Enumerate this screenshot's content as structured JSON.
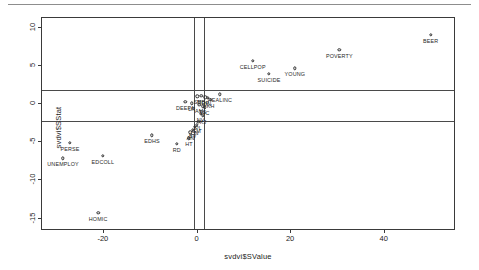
{
  "figure": {
    "x_axis_title": "svdvi$SValue",
    "y_axis_title": "svdvi$SStat",
    "x_ticks": [
      -20,
      0,
      20,
      40
    ],
    "y_ticks": [
      10,
      5,
      0,
      -5,
      -10,
      -15
    ],
    "x_tick_labels": [
      "-20",
      "0",
      "20",
      "40"
    ],
    "y_tick_labels": [
      "10",
      "5",
      "0",
      "-5",
      "-10",
      "-15"
    ],
    "xlim": [
      -33,
      55
    ],
    "ylim": [
      -16.5,
      11.2
    ],
    "grid": false,
    "frame": true,
    "reference_lines": {
      "vertical": [
        -0.6,
        1.7
      ],
      "horizontal": [
        1.8,
        -2.3
      ]
    },
    "marker_color": "#2e2e2e",
    "line_color": "#4a4a4a"
  },
  "chart_data": {
    "type": "scatter",
    "title": "",
    "xlabel": "svdvi$SValue",
    "ylabel": "svdvi$SStat",
    "xlim": [
      -33,
      55
    ],
    "ylim": [
      -16.5,
      11.2
    ],
    "grid": false,
    "legend": "none",
    "points": [
      {
        "label": "BEER",
        "x": 50.0,
        "y": 9.0
      },
      {
        "label": "POVERTY",
        "x": 30.5,
        "y": 7.0
      },
      {
        "label": "CELLPOP",
        "x": 12.0,
        "y": 5.6
      },
      {
        "label": "YOUNG",
        "x": 21.0,
        "y": 4.6
      },
      {
        "label": "SUICIDE",
        "x": 15.5,
        "y": 3.9
      },
      {
        "label": "REALINC",
        "x": 5.0,
        "y": 1.2
      },
      {
        "label": "EDHS",
        "x": -9.5,
        "y": -4.2
      },
      {
        "label": "RD",
        "x": -4.2,
        "y": -5.3
      },
      {
        "label": "HT",
        "x": -1.6,
        "y": -4.6
      },
      {
        "label": "PERSE",
        "x": -27.0,
        "y": -5.2
      },
      {
        "label": "UNEMPLOY",
        "x": -28.5,
        "y": -7.2
      },
      {
        "label": "EDCOLL",
        "x": -20.0,
        "y": -6.9
      },
      {
        "label": "HOMIC",
        "x": -21.0,
        "y": -14.4
      },
      {
        "label": "SB",
        "x": 0.2,
        "y": 0.9
      },
      {
        "label": "MB",
        "x": 1.0,
        "y": 1.0
      },
      {
        "label": "DP",
        "x": 1.9,
        "y": 0.8
      },
      {
        "label": "JN",
        "x": 2.4,
        "y": 0.7
      },
      {
        "label": "KH",
        "x": 3.0,
        "y": 0.5
      },
      {
        "label": "DEEPA",
        "x": -2.4,
        "y": 0.2
      },
      {
        "label": "LR",
        "x": -1.0,
        "y": 0.0
      },
      {
        "label": "AM",
        "x": 0.6,
        "y": -0.2
      },
      {
        "label": "TS",
        "x": 1.3,
        "y": -0.4
      },
      {
        "label": "WC",
        "x": 1.8,
        "y": -0.5
      },
      {
        "label": "NV",
        "x": 0.9,
        "y": -1.4
      },
      {
        "label": "KJ",
        "x": 1.4,
        "y": -1.6
      },
      {
        "label": "PL",
        "x": 0.4,
        "y": -2.4
      },
      {
        "label": "GM",
        "x": 0.0,
        "y": -2.8
      },
      {
        "label": "CN",
        "x": -0.4,
        "y": -3.1
      },
      {
        "label": "BV",
        "x": -0.8,
        "y": -3.5
      },
      {
        "label": "AN",
        "x": -1.3,
        "y": -3.8
      }
    ]
  }
}
